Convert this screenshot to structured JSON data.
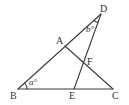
{
  "figure": {
    "type": "geometry-diagram",
    "width": 129,
    "height": 105,
    "stroke_color": "#3a3a3a",
    "text_color": "#333333",
    "points": {
      "A": {
        "label": "A",
        "x": 65,
        "y": 46,
        "lx": 56,
        "ly": 44
      },
      "B": {
        "label": "B",
        "x": 18,
        "y": 89,
        "lx": 10,
        "ly": 99
      },
      "C": {
        "label": "C",
        "x": 113,
        "y": 89,
        "lx": 112,
        "ly": 99
      },
      "D": {
        "label": "D",
        "x": 101,
        "y": 14,
        "lx": 100,
        "ly": 12
      },
      "E": {
        "label": "E",
        "x": 74,
        "y": 89,
        "lx": 69,
        "ly": 99
      },
      "F": {
        "label": "F",
        "x": 86,
        "y": 63,
        "lx": 87,
        "ly": 65
      }
    },
    "segments": [
      {
        "from": "B",
        "to": "D"
      },
      {
        "from": "A",
        "to": "C"
      },
      {
        "from": "D",
        "to": "E"
      },
      {
        "from": "B",
        "to": "C"
      }
    ],
    "angles": [
      {
        "vertex": "B",
        "label": "a°",
        "x": 29,
        "y": 85
      },
      {
        "vertex": "D",
        "label": "b°",
        "x": 86,
        "y": 32
      }
    ]
  }
}
